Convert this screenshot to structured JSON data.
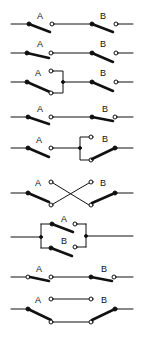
{
  "diagram": {
    "type": "switch-configurations",
    "labels": {
      "a": "A",
      "b": "B"
    },
    "rows": [
      {
        "id": "series-both-open"
      },
      {
        "id": "series-a-closed"
      },
      {
        "id": "a-transfer"
      },
      {
        "id": "series-both-open-2"
      },
      {
        "id": "b-transfer"
      },
      {
        "id": "crossover"
      },
      {
        "id": "parallel"
      },
      {
        "id": "series-both-closed"
      },
      {
        "id": "bypass"
      }
    ]
  }
}
